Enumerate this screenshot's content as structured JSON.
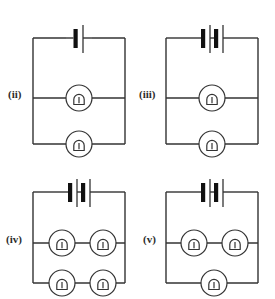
{
  "figure": {
    "title": "",
    "stroke_color": "#333333",
    "fill_color": "#ffffff",
    "background_color": "#ffffff"
  },
  "circuits": [
    {
      "id": "ii",
      "label": "(ii)",
      "cell_count": 1,
      "bulb_count": 2,
      "branches": [
        {
          "name": "middle-branch",
          "bulbs": 1
        },
        {
          "name": "bottom-branch",
          "bulbs": 1
        }
      ],
      "frame": {
        "x": 33,
        "y": 38,
        "width": 92,
        "height": 106
      },
      "middle_wire_y": 98,
      "battery": {
        "x": 79,
        "y": 38
      },
      "bulbs": [
        {
          "name": "bulb-middle",
          "cx": 79,
          "cy": 98
        },
        {
          "name": "bulb-bottom",
          "cx": 79,
          "cy": 144
        }
      ]
    },
    {
      "id": "iii",
      "label": "(iii)",
      "cell_count": 2,
      "bulb_count": 2,
      "branches": [
        {
          "name": "middle-branch",
          "bulbs": 1
        },
        {
          "name": "bottom-branch",
          "bulbs": 1
        }
      ],
      "frame": {
        "x": 166,
        "y": 38,
        "width": 92,
        "height": 106
      },
      "middle_wire_y": 98,
      "battery": {
        "x": 212,
        "y": 38
      },
      "bulbs": [
        {
          "name": "bulb-middle",
          "cx": 212,
          "cy": 98
        },
        {
          "name": "bulb-bottom",
          "cx": 212,
          "cy": 144
        }
      ]
    },
    {
      "id": "iv",
      "label": "(iv)",
      "cell_count": 2,
      "bulb_count": 4,
      "branches": [
        {
          "name": "middle-branch",
          "bulbs": 2
        },
        {
          "name": "bottom-branch",
          "bulbs": 2
        }
      ],
      "frame": {
        "x": 33,
        "y": 192,
        "width": 92,
        "height": 91
      },
      "middle_wire_y": 243,
      "battery": {
        "x": 79,
        "y": 192
      },
      "bulbs": [
        {
          "name": "bulb-middle-left",
          "cx": 62,
          "cy": 243
        },
        {
          "name": "bulb-middle-right",
          "cx": 103,
          "cy": 243
        },
        {
          "name": "bulb-bottom-left",
          "cx": 62,
          "cy": 283
        },
        {
          "name": "bulb-bottom-right",
          "cx": 103,
          "cy": 283
        }
      ]
    },
    {
      "id": "v",
      "label": "(v)",
      "cell_count": 2,
      "bulb_count": 3,
      "branches": [
        {
          "name": "middle-branch",
          "bulbs": 2
        },
        {
          "name": "bottom-branch",
          "bulbs": 1
        }
      ],
      "frame": {
        "x": 166,
        "y": 192,
        "width": 92,
        "height": 91
      },
      "middle_wire_y": 243,
      "battery": {
        "x": 212,
        "y": 192
      },
      "bulbs": [
        {
          "name": "bulb-middle-left",
          "cx": 194,
          "cy": 243
        },
        {
          "name": "bulb-middle-right",
          "cx": 235,
          "cy": 243
        },
        {
          "name": "bulb-bottom-center",
          "cx": 214,
          "cy": 283
        }
      ]
    }
  ],
  "symbols": {
    "cell": {
      "name": "cell-symbol",
      "long_plate_label": "positive terminal (long thin line)",
      "short_plate_label": "negative terminal (short thick bar)"
    },
    "lamp": {
      "name": "lamp-symbol",
      "description": "circle containing an inverted-U filament"
    }
  }
}
